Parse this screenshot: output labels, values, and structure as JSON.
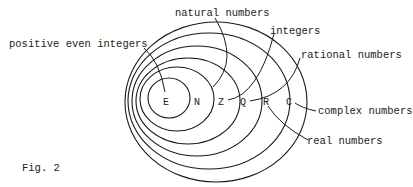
{
  "figure": {
    "caption": "Fig. 2",
    "sets": [
      {
        "symbol": "E",
        "name": "positive even integers"
      },
      {
        "symbol": "N",
        "name": "natural numbers"
      },
      {
        "symbol": "Z",
        "name": "integers"
      },
      {
        "symbol": "Q",
        "name": "rational numbers"
      },
      {
        "symbol": "R",
        "name": "real numbers"
      },
      {
        "symbol": "C",
        "name": "complex numbers"
      }
    ]
  },
  "colors": {
    "stroke": "#1a1a1a",
    "text": "#222222",
    "background": "#ffffff"
  }
}
